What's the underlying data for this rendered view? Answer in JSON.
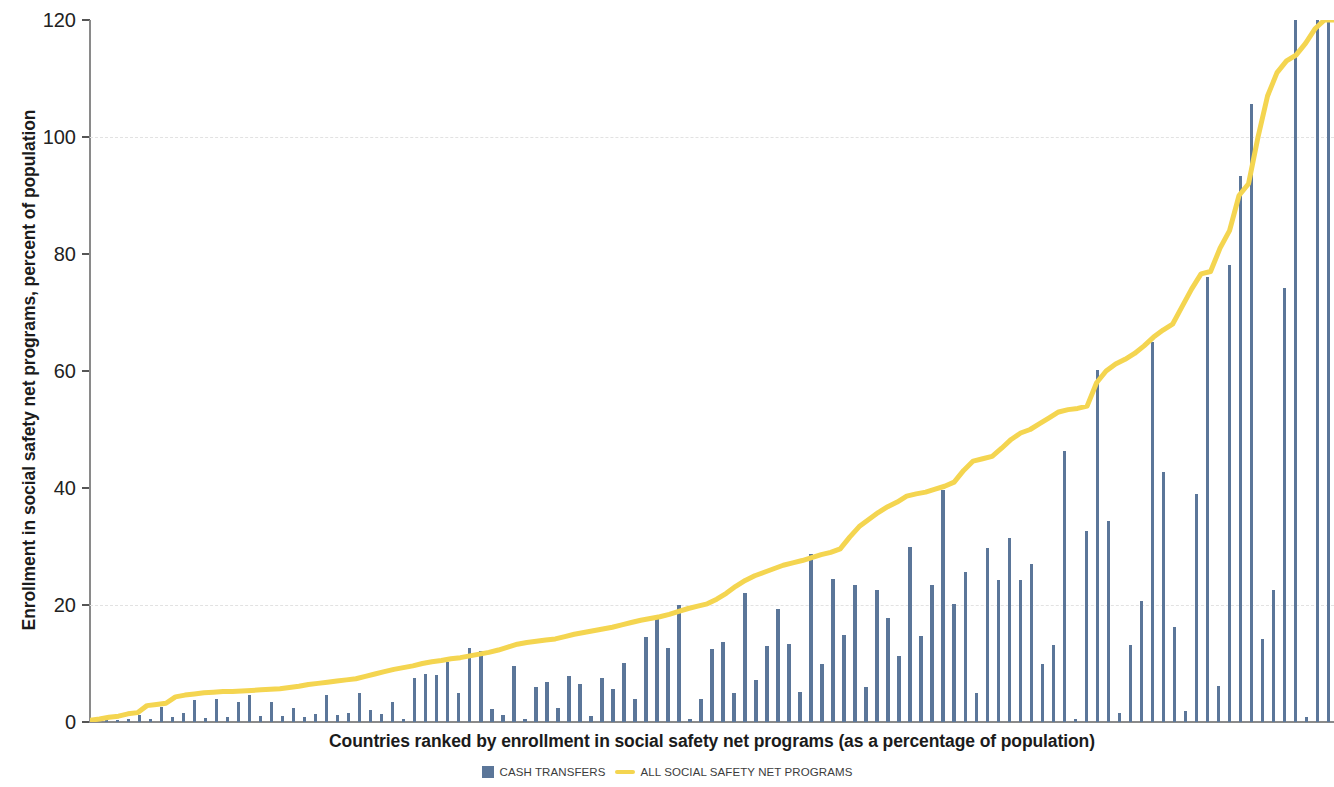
{
  "axes": {
    "ylabel": "Enrollment in social safety net programs, percent of population",
    "xlabel": "Countries ranked by enrollment in social safety net programs (as a percentage of population)",
    "yticks": [
      "0",
      "20",
      "40",
      "60",
      "80",
      "100",
      "120"
    ]
  },
  "legend": {
    "bars_label": "CASH TRANSFERS",
    "line_label": "ALL SOCIAL SAFETY NET PROGRAMS"
  },
  "colors": {
    "bar": "#5b7699",
    "line": "#f4d550",
    "grid": "#e2e2e2",
    "axis": "#8a8a8a",
    "text": "#1b1b1b"
  },
  "chart_data": {
    "type": "bar",
    "title": "",
    "xlabel": "Countries ranked by enrollment in social safety net programs (as a percentage of population)",
    "ylabel": "Enrollment in social safety net programs, percent of population",
    "ylim": [
      0,
      120
    ],
    "yticks": [
      0,
      20,
      40,
      60,
      80,
      100,
      120
    ],
    "grid": true,
    "gridlines_at": [
      20,
      100
    ],
    "legend_position": "bottom-center",
    "x_description": "Countries ranked in ascending order of total social safety net enrollment; individual country names are not shown on the axis.",
    "series": [
      {
        "name": "CASH TRANSFERS",
        "type": "bar",
        "color": "#5b7699",
        "values": [
          0.2,
          0.3,
          0.4,
          0.5,
          1.2,
          0.6,
          2.6,
          0.8,
          1.5,
          3.8,
          0.7,
          4.0,
          0.9,
          3.5,
          4.6,
          1.1,
          3.4,
          1.0,
          2.4,
          0.8,
          1.3,
          4.6,
          1.2,
          1.6,
          5.0,
          2.0,
          1.4,
          3.4,
          0.5,
          7.6,
          8.2,
          8.0,
          10.2,
          5.0,
          12.7,
          12.1,
          2.3,
          1.2,
          9.5,
          0.6,
          6.0,
          6.8,
          2.4,
          7.9,
          6.5,
          1.0,
          7.6,
          5.6,
          10.1,
          3.9,
          14.6,
          17.6,
          12.6,
          20.0,
          0.6,
          4.0,
          12.4,
          13.7,
          5.0,
          22.0,
          7.2,
          13.0,
          19.4,
          13.4,
          5.2,
          28.7,
          9.9,
          24.4,
          14.9,
          23.5,
          6.0,
          22.5,
          17.7,
          11.3,
          30.0,
          14.7,
          23.5,
          39.6,
          20.1,
          25.7,
          4.9,
          29.8,
          24.3,
          31.5,
          24.2,
          27.0,
          9.9,
          13.1,
          46.3,
          0.6,
          32.6,
          60.2,
          34.4,
          1.5,
          13.2,
          20.7,
          65.0,
          42.7,
          16.2,
          1.8,
          38.9,
          76.0,
          6.1,
          78.2,
          93.4,
          105.6,
          14.2,
          22.5,
          74.2,
          120.0,
          0.8,
          120.0,
          120.0
        ]
      },
      {
        "name": "ALL SOCIAL SAFETY NET PROGRAMS",
        "type": "line",
        "color": "#f4d550",
        "values": [
          0.3,
          0.5,
          0.8,
          1.0,
          1.4,
          1.6,
          2.8,
          3.0,
          3.2,
          4.3,
          4.6,
          4.8,
          5.0,
          5.1,
          5.2,
          5.2,
          5.3,
          5.4,
          5.5,
          5.6,
          5.7,
          5.9,
          6.1,
          6.4,
          6.6,
          6.8,
          7.0,
          7.2,
          7.4,
          7.8,
          8.2,
          8.6,
          9.0,
          9.3,
          9.6,
          10.0,
          10.3,
          10.5,
          10.8,
          11.0,
          11.3,
          11.6,
          11.9,
          12.3,
          12.8,
          13.3,
          13.6,
          13.8,
          14.0,
          14.2,
          14.6,
          15.0,
          15.3,
          15.6,
          15.9,
          16.2,
          16.6,
          17.0,
          17.4,
          17.7,
          18.0,
          18.4,
          18.9,
          19.4,
          19.8,
          20.2,
          21.0,
          22.0,
          23.2,
          24.2,
          25.0,
          25.6,
          26.2,
          26.8,
          27.2,
          27.6,
          28.1,
          28.6,
          29.0,
          29.6,
          31.6,
          33.4,
          34.6,
          35.8,
          36.8,
          37.6,
          38.6,
          39.0,
          39.3,
          39.8,
          40.3,
          41.0,
          43.0,
          44.6,
          45.0,
          45.4,
          46.8,
          48.3,
          49.4,
          50.0,
          51.0,
          52.0,
          53.0,
          53.4,
          53.6,
          54.0,
          58.0,
          60.0,
          61.2,
          62.0,
          63.0,
          64.3,
          65.8,
          67.0,
          68.0,
          71.0,
          74.0,
          76.6,
          77.0,
          81.0,
          84.0,
          90.0,
          92.0,
          100.0,
          107.0,
          111.0,
          113.0,
          114.0,
          116.0,
          118.5,
          120.0,
          120.0
        ]
      }
    ]
  }
}
